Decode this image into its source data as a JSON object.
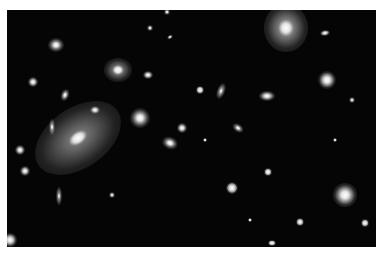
{
  "image": {
    "subject": "galaxy cluster deep-field astronomical photograph",
    "colors": {
      "background": "#050505",
      "border": "#ffffff",
      "glow": "#ffffff"
    },
    "objects": [
      {
        "x": 78,
        "y": 138,
        "rx": 48,
        "ry": 30,
        "rot": -35,
        "core": 7,
        "halo": 0.55
      },
      {
        "x": 286,
        "y": 28,
        "rx": 22,
        "ry": 24,
        "rot": 0,
        "core": 6,
        "halo": 0.6
      },
      {
        "x": 118,
        "y": 70,
        "rx": 14,
        "ry": 12,
        "rot": 0,
        "core": 4,
        "halo": 0.5
      },
      {
        "x": 140,
        "y": 118,
        "rx": 10,
        "ry": 10,
        "rot": 0,
        "core": 4,
        "halo": 0.6
      },
      {
        "x": 345,
        "y": 195,
        "rx": 12,
        "ry": 12,
        "rot": 0,
        "core": 5,
        "halo": 0.6
      },
      {
        "x": 327,
        "y": 80,
        "rx": 9,
        "ry": 9,
        "rot": 0,
        "core": 4,
        "halo": 0.6
      },
      {
        "x": 56,
        "y": 45,
        "rx": 8,
        "ry": 7,
        "rot": 0,
        "core": 3,
        "halo": 0.6
      },
      {
        "x": 267,
        "y": 96,
        "rx": 8,
        "ry": 5,
        "rot": 0,
        "core": 3,
        "halo": 0.7
      },
      {
        "x": 170,
        "y": 143,
        "rx": 8,
        "ry": 6,
        "rot": 20,
        "core": 3,
        "halo": 0.6
      },
      {
        "x": 221,
        "y": 91,
        "rx": 4,
        "ry": 8,
        "rot": 20,
        "core": 2,
        "halo": 0.7
      },
      {
        "x": 238,
        "y": 128,
        "rx": 6,
        "ry": 4,
        "rot": 35,
        "core": 2,
        "halo": 0.6
      },
      {
        "x": 52,
        "y": 127,
        "rx": 3,
        "ry": 8,
        "rot": 0,
        "core": 2,
        "halo": 0.7
      },
      {
        "x": 59,
        "y": 196,
        "rx": 3,
        "ry": 9,
        "rot": 0,
        "core": 2,
        "halo": 0.7
      },
      {
        "x": 25,
        "y": 171,
        "rx": 5,
        "ry": 5,
        "rot": 0,
        "core": 2,
        "halo": 0.7
      },
      {
        "x": 10,
        "y": 240,
        "rx": 7,
        "ry": 7,
        "rot": 0,
        "core": 3,
        "halo": 0.7
      },
      {
        "x": 232,
        "y": 188,
        "rx": 6,
        "ry": 6,
        "rot": 0,
        "core": 3,
        "halo": 0.7
      },
      {
        "x": 268,
        "y": 172,
        "rx": 4,
        "ry": 4,
        "rot": 0,
        "core": 2,
        "halo": 0.7
      },
      {
        "x": 325,
        "y": 33,
        "rx": 5,
        "ry": 3,
        "rot": -10,
        "core": 2,
        "halo": 0.7
      },
      {
        "x": 20,
        "y": 150,
        "rx": 5,
        "ry": 5,
        "rot": 0,
        "core": 2,
        "halo": 0.7
      },
      {
        "x": 200,
        "y": 90,
        "rx": 4,
        "ry": 4,
        "rot": 0,
        "core": 2,
        "halo": 0.7
      },
      {
        "x": 95,
        "y": 110,
        "rx": 5,
        "ry": 4,
        "rot": 0,
        "core": 2,
        "halo": 0.7
      },
      {
        "x": 167,
        "y": 12,
        "rx": 3,
        "ry": 3,
        "rot": 0,
        "core": 1,
        "halo": 0.7
      },
      {
        "x": 150,
        "y": 28,
        "rx": 3,
        "ry": 3,
        "rot": 0,
        "core": 1,
        "halo": 0.7
      },
      {
        "x": 170,
        "y": 37,
        "rx": 3,
        "ry": 2,
        "rot": -30,
        "core": 1,
        "halo": 0.7
      },
      {
        "x": 33,
        "y": 82,
        "rx": 5,
        "ry": 5,
        "rot": 0,
        "core": 2,
        "halo": 0.7
      },
      {
        "x": 65,
        "y": 95,
        "rx": 4,
        "ry": 6,
        "rot": 20,
        "core": 2,
        "halo": 0.7
      },
      {
        "x": 148,
        "y": 75,
        "rx": 5,
        "ry": 4,
        "rot": 0,
        "core": 2,
        "halo": 0.7
      },
      {
        "x": 182,
        "y": 128,
        "rx": 5,
        "ry": 5,
        "rot": 0,
        "core": 2,
        "halo": 0.7
      },
      {
        "x": 352,
        "y": 100,
        "rx": 3,
        "ry": 3,
        "rot": 0,
        "core": 1,
        "halo": 0.7
      },
      {
        "x": 300,
        "y": 222,
        "rx": 4,
        "ry": 4,
        "rot": 0,
        "core": 2,
        "halo": 0.7
      },
      {
        "x": 365,
        "y": 223,
        "rx": 4,
        "ry": 4,
        "rot": 0,
        "core": 2,
        "halo": 0.7
      },
      {
        "x": 272,
        "y": 243,
        "rx": 4,
        "ry": 3,
        "rot": 0,
        "core": 2,
        "halo": 0.7
      },
      {
        "x": 112,
        "y": 195,
        "rx": 3,
        "ry": 3,
        "rot": 0,
        "core": 1,
        "halo": 0.7
      },
      {
        "x": 335,
        "y": 140,
        "rx": 2,
        "ry": 2,
        "rot": 0,
        "core": 1,
        "halo": 0.7
      },
      {
        "x": 205,
        "y": 140,
        "rx": 2,
        "ry": 2,
        "rot": 0,
        "core": 1,
        "halo": 0.7
      },
      {
        "x": 250,
        "y": 220,
        "rx": 2,
        "ry": 2,
        "rot": 0,
        "core": 1,
        "halo": 0.7
      }
    ]
  }
}
